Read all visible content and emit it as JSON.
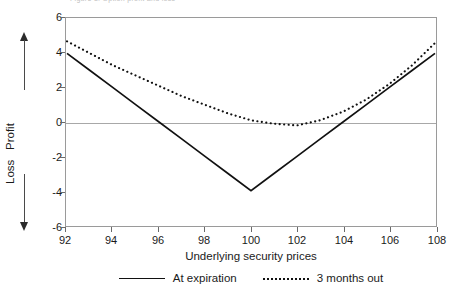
{
  "caption": "Figure 3. Option profit and loss",
  "axes": {
    "y_title_upper": "Profit",
    "y_title_lower": "Loss",
    "x_title": "Underlying security prices",
    "yticks": [
      "6",
      "4",
      "2",
      "0",
      "-2",
      "-4",
      "-6"
    ],
    "xticks": [
      "92",
      "94",
      "96",
      "98",
      "100",
      "102",
      "104",
      "106",
      "108"
    ]
  },
  "legend": {
    "items": [
      {
        "label": "At expiration",
        "style": "solid"
      },
      {
        "label": "3 months out",
        "style": "dotted"
      }
    ]
  },
  "colors": {
    "series_at_expiration": "#111111",
    "series_3_months_out": "#111111",
    "frame": "#9a9a9a",
    "zero_line": "#a8a8a8",
    "background": "#ffffff"
  },
  "chart_data": {
    "type": "line",
    "title": "",
    "xlabel": "Underlying security prices",
    "ylabel": "Profit / Loss",
    "xlim": [
      92,
      108
    ],
    "ylim": [
      -6,
      6
    ],
    "grid": false,
    "legend_position": "bottom",
    "x": [
      92,
      93,
      94,
      95,
      96,
      97,
      98,
      99,
      100,
      101,
      102,
      103,
      104,
      105,
      106,
      107,
      108
    ],
    "series": [
      {
        "name": "At expiration",
        "style": "solid",
        "values": [
          4.0,
          3.0,
          2.0,
          1.0,
          0.0,
          -1.0,
          -2.0,
          -3.0,
          -4.0,
          -3.0,
          -2.0,
          -1.0,
          0.0,
          1.0,
          2.0,
          3.0,
          4.0
        ]
      },
      {
        "name": "3 months out",
        "style": "dotted",
        "values": [
          4.7,
          4.0,
          3.3,
          2.7,
          2.1,
          1.5,
          1.0,
          0.5,
          0.1,
          -0.1,
          -0.2,
          0.1,
          0.6,
          1.3,
          2.2,
          3.3,
          4.6
        ]
      }
    ],
    "annotations": [
      "At expiration payoff is a V shape with minimum -4 at underlying price 100",
      "3 months out curve is smooth with minimum about -0.2 near price 101"
    ]
  }
}
